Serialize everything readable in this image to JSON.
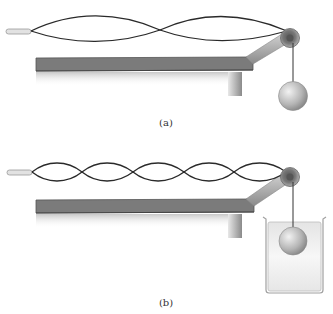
{
  "figure": {
    "panels": [
      {
        "id": "a",
        "label": "(a)",
        "string_loops": 2,
        "weight_in_water": false
      },
      {
        "id": "b",
        "label": "(b)",
        "string_loops": 5,
        "weight_in_water": true
      }
    ],
    "colors": {
      "string": "#2a2a2a",
      "table_top": "#7a7a7a",
      "table_edge": "#5a5a5a",
      "ball": "#b8b8b8",
      "water": "#eeeeee",
      "beaker_outline": "#aaaaaa"
    }
  }
}
